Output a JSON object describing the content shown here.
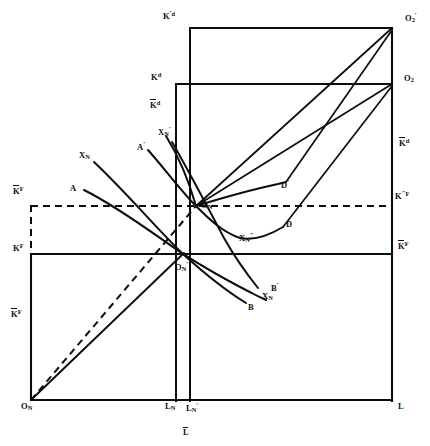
{
  "figure": {
    "name": "two-sector-factor-allocation-box-diagram",
    "type": "geometric-line-diagram",
    "background": "#ffffff",
    "line_color": "#0d0d0d",
    "axes": {
      "origin_label": "O",
      "origin_sub": "N",
      "horizontal_axis_label": "L",
      "horizontal_axis_label_bar": "L"
    },
    "labels": [
      {
        "id": "K-prime-d-top-left",
        "base": "K",
        "prime": "′",
        "sup": "d",
        "bar": false,
        "x": 163,
        "y": 12
      },
      {
        "id": "O2-prime-top-right",
        "base": "O",
        "sub": "2",
        "prime": "′",
        "x": 406,
        "y": 14
      },
      {
        "id": "Kd-left",
        "base": "K",
        "sup": "d",
        "bar": false,
        "x": 152,
        "y": 74
      },
      {
        "id": "O2-right",
        "base": "O",
        "sub": "2",
        "x": 404,
        "y": 76
      },
      {
        "id": "Kbar-d-left",
        "base": "K",
        "sup": "d",
        "bar": true,
        "x": 151,
        "y": 102
      },
      {
        "id": "Kbar-d-right",
        "base": "K",
        "sup": "d",
        "bar": true,
        "x": 400,
        "y": 140
      },
      {
        "id": "XN-prime-curve",
        "base": "X",
        "sub": "N",
        "prime": "′",
        "x": 159,
        "y": 129
      },
      {
        "id": "A-prime-curve",
        "base": "A",
        "prime": "′",
        "x": 139,
        "y": 143
      },
      {
        "id": "XN-curve",
        "base": "X",
        "sub": "N",
        "x": 80,
        "y": 153
      },
      {
        "id": "A-curve",
        "base": "A",
        "x": 71,
        "y": 186
      },
      {
        "id": "Kbar-F-upper-left",
        "base": "K",
        "sup": "F",
        "bar": true,
        "x": 14,
        "y": 188
      },
      {
        "id": "K-dprime-F-right",
        "base": "K",
        "prime": "″",
        "sup": "F",
        "x": 396,
        "y": 192
      },
      {
        "id": "D-prime-curve",
        "base": "D",
        "prime": "′",
        "x": 281,
        "y": 181
      },
      {
        "id": "ON-dprime",
        "base": "O",
        "sub": "N",
        "prime": "″",
        "x": 202,
        "y": 201
      },
      {
        "id": "D-curve",
        "base": "D",
        "x": 286,
        "y": 222
      },
      {
        "id": "XN-dprime-curve",
        "base": "X",
        "sub": "N",
        "prime": "″",
        "x": 240,
        "y": 234
      },
      {
        "id": "KF-left",
        "base": "K",
        "sup": "F",
        "bar": false,
        "x": 14,
        "y": 245
      },
      {
        "id": "Kbar-F-right",
        "base": "K",
        "sup": "F",
        "bar": true,
        "x": 399,
        "y": 243
      },
      {
        "id": "ON-prime",
        "base": "O",
        "sub": "N",
        "prime": "′",
        "x": 176,
        "y": 263
      },
      {
        "id": "B-prime-curve",
        "base": "B",
        "prime": "′",
        "x": 272,
        "y": 284
      },
      {
        "id": "XN-prime2-curve",
        "base": "X",
        "sub": "N",
        "prime": "′",
        "x": 263,
        "y": 294
      },
      {
        "id": "B-curve",
        "base": "B",
        "x": 249,
        "y": 305
      },
      {
        "id": "Kbar-F-lower-left",
        "base": "K",
        "sup": "F",
        "bar": true,
        "x": 12,
        "y": 311
      },
      {
        "id": "ON-origin",
        "base": "O",
        "sub": "N",
        "x": 22,
        "y": 414
      },
      {
        "id": "LN-bottom",
        "base": "L",
        "sub": "N",
        "x": 166,
        "y": 414
      },
      {
        "id": "LN-prime-bottom",
        "base": "L",
        "sub": "N",
        "prime": "′",
        "x": 188,
        "y": 414
      },
      {
        "id": "L-bottom-right",
        "base": "L",
        "x": 399,
        "y": 414
      },
      {
        "id": "Lbar-bottom-center",
        "base": "L",
        "bar": true,
        "x": 184,
        "y": 432
      }
    ],
    "geometry": {
      "solid_lines": [
        {
          "id": "bottom-axis",
          "x1": 31,
          "y1": 400,
          "x2": 392,
          "y2": 400
        },
        {
          "id": "left-vertical-axis",
          "x1": 31,
          "y1": 400,
          "x2": 31,
          "y2": 254
        },
        {
          "id": "right-vertical-axis",
          "x1": 392,
          "y1": 400,
          "x2": 392,
          "y2": 28
        },
        {
          "id": "kf-horizontal",
          "x1": 31,
          "y1": 254,
          "x2": 392,
          "y2": 254
        },
        {
          "id": "kd-horizontal",
          "x1": 176,
          "y1": 84,
          "x2": 392,
          "y2": 84
        },
        {
          "id": "kprimed-horizontal",
          "x1": 190,
          "y1": 28,
          "x2": 392,
          "y2": 28
        },
        {
          "id": "LN-vertical",
          "x1": 176,
          "y1": 400,
          "x2": 176,
          "y2": 84
        },
        {
          "id": "LNprime-vertical",
          "x1": 190,
          "y1": 400,
          "x2": 190,
          "y2": 28
        },
        {
          "id": "diagonal-ON-to-center",
          "x1": 31,
          "y1": 400,
          "x2": 183,
          "y2": 254
        },
        {
          "id": "diagonal-O2-to-ONdprime",
          "x1": 392,
          "y1": 84,
          "x2": 196,
          "y2": 206
        },
        {
          "id": "diagonal-O2prime-to-ONdprime",
          "x1": 392,
          "y1": 28,
          "x2": 196,
          "y2": 206
        }
      ],
      "dashed_lines": [
        {
          "id": "kbarF-horizontal-dashed",
          "x1": 31,
          "y1": 206,
          "x2": 392,
          "y2": 206
        },
        {
          "id": "kbarF-vertical-dashed",
          "x1": 31,
          "y1": 206,
          "x2": 31,
          "y2": 254
        },
        {
          "id": "diagonal-dashed-ON-to-ONdprime",
          "x1": 31,
          "y1": 400,
          "x2": 196,
          "y2": 206
        }
      ],
      "curves": [
        {
          "id": "curve-A-to-Bprime",
          "label_start": "A",
          "label_end": "B′"
        },
        {
          "id": "curve-XN-to-B",
          "label_start": "X",
          "label_end": "B"
        },
        {
          "id": "curve-Aprime-to-XNdprime-D",
          "label_start": "A′",
          "label_end": "D"
        },
        {
          "id": "curve-XNprime-to-Dprime",
          "label_start": "X′",
          "label_end": "D′"
        },
        {
          "id": "curve-ONdprime-to-D",
          "label_start": "O″",
          "label_end": "D"
        }
      ]
    }
  }
}
